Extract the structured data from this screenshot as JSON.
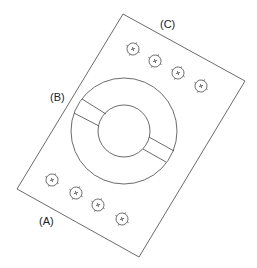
{
  "diagram": {
    "labels": {
      "a": "(A)",
      "b": "(B)",
      "c": "(C)"
    },
    "colors": {
      "stroke": "#555555",
      "background": "#ffffff",
      "text": "#222222"
    },
    "plate": {
      "corners": [
        [
          123,
          14
        ],
        [
          245,
          81
        ],
        [
          139,
          257
        ],
        [
          17,
          189
        ]
      ]
    },
    "ring": {
      "center": [
        124,
        131
      ],
      "outer_radius": 53,
      "inner_radius": 26
    },
    "holes_top_row": [
      [
        133,
        49
      ],
      [
        155,
        61
      ],
      [
        178,
        73
      ],
      [
        201,
        86
      ]
    ],
    "holes_bottom_row": [
      [
        52,
        180
      ],
      [
        76,
        193
      ],
      [
        98,
        205
      ],
      [
        122,
        219
      ]
    ]
  }
}
